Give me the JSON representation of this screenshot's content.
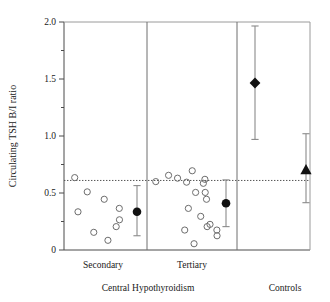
{
  "chart_data": {
    "type": "scatter",
    "title": "",
    "xlabel": "",
    "ylabel": "Circulating TSH B/I ratio",
    "ylim": [
      0,
      2.0
    ],
    "y_ticks": [
      0,
      0.5,
      1.0,
      1.5,
      2.0
    ],
    "y_tick_labels": [
      "0",
      "0.5",
      "1.0",
      "1.5",
      "2.0"
    ],
    "y_minor_ticks": [
      0.25,
      0.75,
      1.25,
      1.75
    ],
    "grid": false,
    "legend": "none",
    "reference_line": {
      "label": "normal lower limit",
      "value": 0.61,
      "style": "dotted"
    },
    "panel_dividers": [
      1,
      2
    ],
    "groups": [
      {
        "name": "Secondary",
        "panel": 0,
        "marker": "open-circle",
        "points": [
          0.155,
          0.51,
          0.365,
          0.445,
          0.265,
          0.085,
          0.335,
          0.205,
          0.635
        ],
        "mean": {
          "value": 0.335,
          "low": 0.125,
          "high": 0.565,
          "marker": "filled-circle"
        }
      },
      {
        "name": "Tertiary",
        "panel": 1,
        "marker": "open-circle",
        "points": [
          0.6,
          0.655,
          0.295,
          0.205,
          0.125,
          0.365,
          0.505,
          0.175,
          0.695,
          0.595,
          0.63,
          0.445,
          0.055,
          0.505,
          0.225,
          0.175,
          0.62,
          0.585
        ],
        "mean": {
          "value": 0.41,
          "low": 0.205,
          "high": 0.615,
          "marker": "filled-circle"
        }
      },
      {
        "name": "Controls",
        "panel": 2,
        "marker": "none",
        "points": [],
        "series": [
          {
            "name": "control-diamond",
            "marker": "filled-diamond",
            "value": 1.465,
            "low": 0.97,
            "high": 1.965
          },
          {
            "name": "control-triangle",
            "marker": "filled-triangle",
            "value": 0.705,
            "low": 0.415,
            "high": 1.02
          }
        ]
      }
    ],
    "x_group_labels": [
      "Secondary",
      "Tertiary",
      "Controls"
    ],
    "x_super_labels": [
      "Central Hypothyroidism",
      "Controls"
    ]
  },
  "axis": {
    "y_title": "Circulating TSH B/I ratio",
    "t0": "0",
    "t1": "0.5",
    "t2": "1.0",
    "t3": "1.5",
    "t4": "2.0"
  },
  "labels": {
    "secondary": "Secondary",
    "tertiary": "Tertiary",
    "controls": "Controls",
    "central_hypothyroidism": "Central Hypothyroidism"
  },
  "colors": {
    "axis": "#4a4a4a",
    "marker_open_stroke": "#6d6d6d",
    "marker_filled": "#111111",
    "errorbar": "#8a8a8a",
    "reference_line": "#555555",
    "text": "#1a1a1a",
    "background": "#ffffff"
  }
}
